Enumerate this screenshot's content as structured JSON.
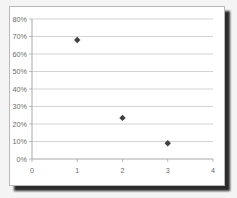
{
  "chart_data": {
    "type": "scatter",
    "title": "",
    "subtitle": "",
    "xlabel": "",
    "ylabel": "",
    "x": [
      1,
      2,
      3
    ],
    "values": [
      0.68,
      0.235,
      0.09
    ],
    "point_labels": [
      "68%",
      "23.5%",
      "9%"
    ],
    "xlim": [
      0,
      4
    ],
    "ylim": [
      0,
      0.8
    ],
    "xticks": [
      0,
      1,
      2,
      3,
      4
    ],
    "xtick_labels": [
      "0",
      "1",
      "2",
      "3",
      "4"
    ],
    "yticks": [
      0,
      0.1,
      0.2,
      0.3,
      0.4,
      0.5,
      0.6,
      0.7,
      0.8
    ],
    "ytick_labels": [
      "0%",
      "10%",
      "20%",
      "30%",
      "40%",
      "50%",
      "60%",
      "70%",
      "80%"
    ],
    "grid": "horizontal",
    "legend": "none",
    "series": [
      {
        "name": "series-1",
        "marker": "diamond",
        "color": "#404040",
        "points": [
          {
            "x": 1,
            "y": 0.68
          },
          {
            "x": 2,
            "y": 0.235
          },
          {
            "x": 3,
            "y": 0.09
          }
        ]
      }
    ],
    "colors": {
      "marker": "#404040",
      "gridline": "#c8c8c8",
      "axis": "#a8a8a8",
      "tick_label": "#6a6a6a",
      "plot_background": "#ffffff",
      "card_border": "#b9b9b9",
      "page_background": "#f4f4f4"
    }
  }
}
